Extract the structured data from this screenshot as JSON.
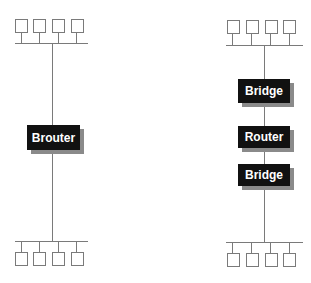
{
  "left_network": {
    "device": {
      "label": "Brouter",
      "icon": "brouter-box"
    },
    "top_segment": {
      "hosts": 4
    },
    "bottom_segment": {
      "hosts": 4
    }
  },
  "right_network": {
    "devices": [
      {
        "label": "Bridge",
        "icon": "bridge-box"
      },
      {
        "label": "Router",
        "icon": "router-box"
      },
      {
        "label": "Bridge",
        "icon": "bridge-box"
      }
    ],
    "top_segment": {
      "hosts": 4
    },
    "bottom_segment": {
      "hosts": 4
    }
  },
  "colors": {
    "line": "#7a7a7a",
    "device_fill": "#111111",
    "device_text": "#ffffff",
    "shadow": "#8a8a8a"
  }
}
